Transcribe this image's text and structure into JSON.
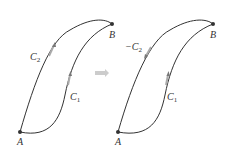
{
  "left": {
    "point_a": "A",
    "point_b": "B",
    "curve_upper": {
      "name": "C",
      "sub": "2"
    },
    "curve_lower": {
      "name": "C",
      "sub": "1"
    }
  },
  "right": {
    "point_a": "A",
    "point_b": "B",
    "curve_upper": {
      "name": "−C",
      "sub": "2"
    },
    "curve_lower": {
      "name": "C",
      "sub": "1"
    }
  },
  "transition_arrow": "implies-arrow",
  "colors": {
    "curve": "#333333",
    "arrow_highlight": "#9a9a9a",
    "transition": "#cccccc"
  }
}
